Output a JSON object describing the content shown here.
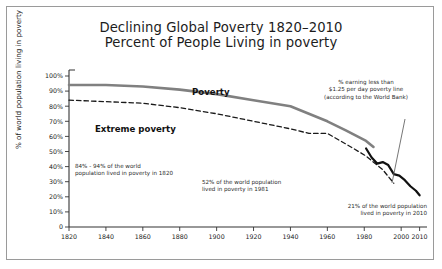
{
  "figure": {
    "title_line1": "Declining Global Poverty 1820–2010",
    "title_line2": "Percent of People Living in poverty",
    "frame_color": "#9a9a9a",
    "background": "#ffffff"
  },
  "annotations": {
    "worldbank": "% earning less than\n$1.25 per day poverty line\n(according to the World Bank)",
    "y1820": "84% - 94% of the world\npopulation lived in poverty in 1820",
    "y1981": "52% of the world population\nlived in poverty in 1981",
    "y2010": "21% of the world population\nlived in poverty in 2010"
  },
  "series_labels": {
    "poverty": "Poverty",
    "extreme_poverty": "Extreme poverty"
  },
  "chart_data": {
    "type": "line",
    "xlabel": "",
    "ylabel": "% of world population living in poverty",
    "xlim": [
      1820,
      2014
    ],
    "ylim": [
      0,
      100
    ],
    "grid": false,
    "legend": "inline-labels",
    "xticks": [
      1820,
      1840,
      1860,
      1880,
      1900,
      1920,
      1940,
      1960,
      1980,
      2000,
      2010
    ],
    "xtick_labels": [
      "1820",
      "1840",
      "1860",
      "1880",
      "1900",
      "1920",
      "1940",
      "1960",
      "1980",
      "2000",
      "2010"
    ],
    "yticks": [
      0,
      10,
      20,
      30,
      40,
      50,
      60,
      70,
      80,
      90,
      100
    ],
    "ytick_labels": [
      "0",
      "10%",
      "20%",
      "30%",
      "40%",
      "50%",
      "60%",
      "70%",
      "80%",
      "90%",
      "100%"
    ],
    "series": [
      {
        "name": "Poverty",
        "style": "solid",
        "color": "#808080",
        "width": 2.6,
        "x": [
          1820,
          1840,
          1860,
          1880,
          1900,
          1920,
          1940,
          1950,
          1960,
          1970,
          1981,
          1985
        ],
        "values": [
          94,
          94,
          93,
          91,
          88,
          84,
          80,
          75,
          70,
          64,
          57,
          53
        ]
      },
      {
        "name": "Extreme poverty",
        "style": "dashed",
        "color": "#1a1a1a",
        "width": 1.3,
        "x": [
          1820,
          1840,
          1860,
          1880,
          1900,
          1920,
          1940,
          1950,
          1960,
          1970,
          1981,
          1990,
          1996
        ],
        "values": [
          84,
          83,
          82,
          79,
          75,
          70,
          65,
          62,
          62,
          55,
          47,
          38,
          29
        ]
      },
      {
        "name": "% earning less than $1.25 per day poverty line (World Bank)",
        "style": "solid",
        "color": "#111111",
        "width": 2.2,
        "x": [
          1981,
          1984,
          1987,
          1990,
          1993,
          1996,
          1999,
          2002,
          2005,
          2008,
          2010
        ],
        "values": [
          52,
          46,
          42,
          43,
          41,
          35,
          34,
          31,
          27,
          24,
          21
        ]
      }
    ],
    "annotations": [
      {
        "text": "84% - 94% of the world population lived in poverty in 1820",
        "x": 1820,
        "y": 89
      },
      {
        "text": "52% of the world population lived in poverty in 1981",
        "x": 1981,
        "y": 52
      },
      {
        "text": "21% of the world population lived in poverty in 2010",
        "x": 2010,
        "y": 21
      },
      {
        "text": "% earning less than $1.25 per day poverty line (according to the World Bank)",
        "x": 1995,
        "y": 35
      }
    ]
  }
}
